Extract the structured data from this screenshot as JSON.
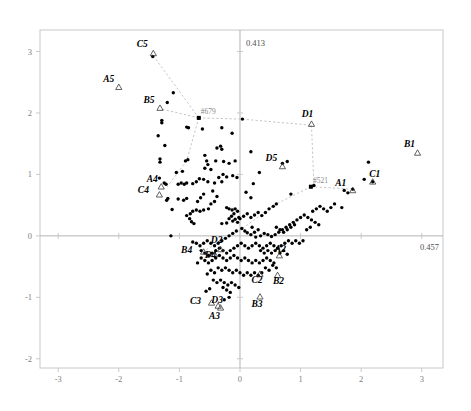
{
  "chart_data": {
    "type": "scatter",
    "title": "",
    "subtitle": "",
    "xlabel": "",
    "ylabel": "",
    "xlim": [
      -3.3,
      3.35
    ],
    "ylim": [
      -2.15,
      3.35
    ],
    "grid": false,
    "legend": null,
    "xticks": [
      "-3",
      "-2",
      "-1",
      "0",
      "1",
      "2",
      "3"
    ],
    "xtick_values": [
      -3,
      -2,
      -1,
      0,
      1,
      2,
      3
    ],
    "yticks": [
      "3",
      "2",
      "1",
      "0",
      "-1",
      "-2"
    ],
    "ytick_values": [
      3,
      2,
      1,
      0,
      -1,
      -2
    ],
    "axis_inertia": {
      "vertical_label": "0.413",
      "horizontal_label": "0.457"
    },
    "annotations": [
      {
        "name": "#679",
        "x": -0.68,
        "y": 1.92
      },
      {
        "name": "#521",
        "x": 1.17,
        "y": 0.8
      }
    ],
    "labeled_points": [
      {
        "label": "A1",
        "x": 1.86,
        "y": 0.74
      },
      {
        "label": "B1",
        "x": 2.93,
        "y": 1.35
      },
      {
        "label": "C1",
        "x": 2.19,
        "y": 0.88
      },
      {
        "label": "D1",
        "x": 1.18,
        "y": 1.82
      },
      {
        "label": "A2",
        "x": 0.65,
        "y": -0.32
      },
      {
        "label": "B2",
        "x": 0.62,
        "y": -0.64
      },
      {
        "label": "C2",
        "x": 0.33,
        "y": -0.62
      },
      {
        "label": "D2",
        "x": -0.32,
        "y": -0.22
      },
      {
        "label": "A3",
        "x": -0.32,
        "y": -1.17
      },
      {
        "label": "B3",
        "x": 0.33,
        "y": -0.99
      },
      {
        "label": "C3",
        "x": -0.47,
        "y": -1.09
      },
      {
        "label": "D3",
        "x": -0.36,
        "y": -1.14
      },
      {
        "label": "A4",
        "x": -1.3,
        "y": 0.8
      },
      {
        "label": "B4",
        "x": -0.6,
        "y": -0.26
      },
      {
        "label": "C4",
        "x": -1.33,
        "y": 0.67
      },
      {
        "label": "D4",
        "x": -0.42,
        "y": -0.3
      },
      {
        "label": "A5",
        "x": -2.0,
        "y": 2.42
      },
      {
        "label": "B5",
        "x": -1.32,
        "y": 2.08
      },
      {
        "label": "C5",
        "x": -1.43,
        "y": 2.97
      },
      {
        "label": "D5",
        "x": 0.7,
        "y": 1.13
      }
    ],
    "label_offsets": {
      "A1": [
        -12,
        -4
      ],
      "B1": [
        -8,
        -6
      ],
      "C1": [
        2,
        -5
      ],
      "D1": [
        -4,
        -7
      ],
      "A2": [
        1,
        -4
      ],
      "B2": [
        1,
        9
      ],
      "C2": [
        -3,
        9
      ],
      "D2": [
        -4,
        -6
      ],
      "A3": [
        -6,
        11
      ],
      "B3": [
        -3,
        10
      ],
      "C3": [
        -16,
        1
      ],
      "D3": [
        -1,
        -3
      ],
      "A4": [
        -9,
        -5
      ],
      "B4": [
        -17,
        1
      ],
      "C4": [
        -16,
        -2
      ],
      "D4": [
        -4,
        4
      ],
      "A5": [
        -10,
        -5
      ],
      "B5": [
        -11,
        -5
      ],
      "C5": [
        -11,
        -6
      ],
      "D5": [
        -11,
        -5
      ]
    },
    "polygon_links": [
      [
        [
          -1.43,
          2.93
        ],
        [
          -0.68,
          1.92
        ]
      ],
      [
        [
          -1.28,
          2.06
        ],
        [
          -0.68,
          1.92
        ]
      ],
      [
        [
          -0.68,
          1.92
        ],
        [
          -0.88,
          1.22
        ]
      ],
      [
        [
          -0.88,
          1.22
        ],
        [
          -1.2,
          0.8
        ]
      ],
      [
        [
          -0.68,
          1.92
        ],
        [
          0.04,
          1.9
        ]
      ],
      [
        [
          0.04,
          1.9
        ],
        [
          1.18,
          1.8
        ]
      ],
      [
        [
          1.18,
          1.8
        ],
        [
          1.22,
          0.82
        ]
      ],
      [
        [
          1.22,
          0.82
        ],
        [
          1.17,
          0.8
        ]
      ],
      [
        [
          1.17,
          0.8
        ],
        [
          1.86,
          0.76
        ]
      ],
      [
        [
          1.17,
          0.8
        ],
        [
          0.6,
          0.52
        ]
      ],
      [
        [
          0.6,
          0.52
        ],
        [
          -0.02,
          0.08
        ]
      ],
      [
        [
          -0.02,
          0.08
        ],
        [
          -0.62,
          -0.26
        ]
      ],
      [
        [
          -0.62,
          -0.26
        ],
        [
          -0.42,
          -0.3
        ]
      ]
    ],
    "points": [
      [
        -1.44,
        2.92
      ],
      [
        -1.1,
        2.33
      ],
      [
        -1.2,
        2.17
      ],
      [
        -1.29,
        1.88
      ],
      [
        -1.29,
        1.84
      ],
      [
        -1.35,
        1.63
      ],
      [
        -1.24,
        1.47
      ],
      [
        -1.32,
        1.25
      ],
      [
        -1.32,
        1.2
      ],
      [
        -1.33,
        0.94
      ],
      [
        -1.25,
        0.86
      ],
      [
        -1.22,
        0.84
      ],
      [
        -1.19,
        0.61
      ],
      [
        -1.21,
        0.58
      ],
      [
        -1.12,
        0.43
      ],
      [
        -1.14,
        0.0
      ],
      [
        -0.68,
        1.92
      ],
      [
        -0.88,
        1.77
      ],
      [
        -0.85,
        1.76
      ],
      [
        -0.62,
        1.74
      ],
      [
        -0.3,
        1.76
      ],
      [
        -0.13,
        1.67
      ],
      [
        0.04,
        1.9
      ],
      [
        -0.38,
        1.43
      ],
      [
        -0.3,
        1.41
      ],
      [
        -0.32,
        1.46
      ],
      [
        -0.58,
        1.31
      ],
      [
        -0.55,
        1.22
      ],
      [
        -0.53,
        1.16
      ],
      [
        -0.58,
        1.1
      ],
      [
        -0.48,
        1.08
      ],
      [
        -0.4,
        1.22
      ],
      [
        -0.27,
        1.21
      ],
      [
        -0.18,
        1.18
      ],
      [
        -0.08,
        1.22
      ],
      [
        0.18,
        1.37
      ],
      [
        0.32,
        1.03
      ],
      [
        0.7,
        1.18
      ],
      [
        0.78,
        1.21
      ],
      [
        0.22,
        0.85
      ],
      [
        0.1,
        0.71
      ],
      [
        0.18,
        0.62
      ],
      [
        -0.05,
        0.95
      ],
      [
        -0.12,
        0.98
      ],
      [
        -0.22,
        0.96
      ],
      [
        -0.28,
        1.0
      ],
      [
        -0.35,
        0.95
      ],
      [
        -0.3,
        0.88
      ],
      [
        -0.42,
        0.86
      ],
      [
        -0.53,
        0.88
      ],
      [
        -0.6,
        0.92
      ],
      [
        -0.67,
        0.93
      ],
      [
        -0.72,
        0.88
      ],
      [
        -0.78,
        0.85
      ],
      [
        -0.88,
        0.86
      ],
      [
        -0.92,
        0.84
      ],
      [
        -0.97,
        0.86
      ],
      [
        -1.02,
        0.84
      ],
      [
        -0.88,
        0.61
      ],
      [
        -0.93,
        0.58
      ],
      [
        -1.02,
        0.6
      ],
      [
        -0.45,
        0.73
      ],
      [
        -0.38,
        0.64
      ],
      [
        -0.42,
        0.56
      ],
      [
        -0.48,
        0.52
      ],
      [
        -0.52,
        0.44
      ],
      [
        -0.6,
        0.42
      ],
      [
        -0.66,
        0.4
      ],
      [
        -0.72,
        0.42
      ],
      [
        -0.78,
        0.4
      ],
      [
        -0.82,
        0.36
      ],
      [
        -0.88,
        0.33
      ],
      [
        -0.83,
        0.28
      ],
      [
        -0.8,
        0.23
      ],
      [
        -0.76,
        0.2
      ],
      [
        -0.6,
        0.68
      ],
      [
        -0.65,
        0.62
      ],
      [
        -0.7,
        0.56
      ],
      [
        -0.22,
        0.46
      ],
      [
        -0.18,
        0.44
      ],
      [
        -0.13,
        0.42
      ],
      [
        -0.08,
        0.44
      ],
      [
        -0.04,
        0.4
      ],
      [
        -0.1,
        0.36
      ],
      [
        -0.14,
        0.32
      ],
      [
        -0.18,
        0.28
      ],
      [
        -0.12,
        0.24
      ],
      [
        -0.08,
        0.27
      ],
      [
        -0.04,
        0.22
      ],
      [
        -0.22,
        0.21
      ],
      [
        -0.3,
        0.2
      ],
      [
        -0.02,
        0.3
      ],
      [
        0.03,
        0.12
      ],
      [
        0.08,
        0.08
      ],
      [
        0.12,
        0.05
      ],
      [
        0.18,
        0.02
      ],
      [
        0.24,
        0.06
      ],
      [
        0.3,
        0.1
      ],
      [
        0.2,
        0.14
      ],
      [
        0.26,
        -0.02
      ],
      [
        0.34,
        0.0
      ],
      [
        0.4,
        0.04
      ],
      [
        0.46,
        0.02
      ],
      [
        0.52,
        -0.01
      ],
      [
        0.58,
        0.02
      ],
      [
        0.64,
        0.06
      ],
      [
        0.7,
        0.1
      ],
      [
        0.76,
        0.14
      ],
      [
        0.82,
        0.18
      ],
      [
        0.88,
        0.22
      ],
      [
        0.94,
        0.26
      ],
      [
        1.0,
        0.3
      ],
      [
        1.06,
        0.34
      ],
      [
        1.12,
        0.3
      ],
      [
        1.18,
        0.26
      ],
      [
        1.24,
        0.22
      ],
      [
        1.3,
        0.18
      ],
      [
        1.2,
        0.4
      ],
      [
        1.26,
        0.44
      ],
      [
        1.32,
        0.48
      ],
      [
        1.38,
        0.44
      ],
      [
        1.44,
        0.4
      ],
      [
        1.5,
        0.46
      ],
      [
        1.56,
        0.52
      ],
      [
        1.68,
        0.46
      ],
      [
        1.72,
        0.74
      ],
      [
        1.78,
        0.7
      ],
      [
        1.86,
        0.76
      ],
      [
        2.05,
        0.92
      ],
      [
        2.12,
        1.2
      ],
      [
        2.19,
        0.88
      ],
      [
        1.17,
        0.8
      ],
      [
        1.22,
        0.82
      ],
      [
        0.84,
        0.68
      ],
      [
        0.6,
        0.52
      ],
      [
        0.55,
        0.48
      ],
      [
        0.48,
        0.44
      ],
      [
        0.42,
        0.38
      ],
      [
        0.36,
        0.33
      ],
      [
        0.3,
        0.38
      ],
      [
        0.24,
        0.34
      ],
      [
        0.18,
        0.3
      ],
      [
        0.12,
        0.36
      ],
      [
        0.06,
        0.32
      ],
      [
        0.0,
        0.28
      ],
      [
        -0.06,
        0.08
      ],
      [
        -0.12,
        0.04
      ],
      [
        -0.18,
        0.0
      ],
      [
        -0.24,
        -0.04
      ],
      [
        -0.3,
        -0.08
      ],
      [
        -0.36,
        -0.12
      ],
      [
        -0.42,
        -0.16
      ],
      [
        -0.48,
        -0.12
      ],
      [
        -0.54,
        -0.08
      ],
      [
        -0.6,
        -0.12
      ],
      [
        -0.66,
        -0.16
      ],
      [
        -0.72,
        -0.12
      ],
      [
        -0.78,
        -0.1
      ],
      [
        -0.64,
        -0.24
      ],
      [
        -0.58,
        -0.28
      ],
      [
        -0.52,
        -0.32
      ],
      [
        -0.46,
        -0.28
      ],
      [
        -0.4,
        -0.24
      ],
      [
        -0.34,
        -0.2
      ],
      [
        -0.28,
        -0.24
      ],
      [
        -0.22,
        -0.28
      ],
      [
        -0.16,
        -0.24
      ],
      [
        -0.1,
        -0.2
      ],
      [
        -0.04,
        -0.16
      ],
      [
        0.02,
        -0.12
      ],
      [
        0.08,
        -0.16
      ],
      [
        0.14,
        -0.2
      ],
      [
        0.2,
        -0.16
      ],
      [
        0.26,
        -0.12
      ],
      [
        0.32,
        -0.16
      ],
      [
        0.38,
        -0.2
      ],
      [
        0.44,
        -0.16
      ],
      [
        0.5,
        -0.12
      ],
      [
        0.56,
        -0.16
      ],
      [
        0.62,
        -0.2
      ],
      [
        0.68,
        -0.16
      ],
      [
        0.74,
        -0.12
      ],
      [
        0.8,
        -0.08
      ],
      [
        0.86,
        -0.12
      ],
      [
        0.92,
        -0.08
      ],
      [
        0.98,
        -0.12
      ],
      [
        1.04,
        -0.08
      ],
      [
        1.1,
        0.1
      ],
      [
        1.16,
        0.14
      ],
      [
        0.9,
        0.18
      ],
      [
        0.84,
        0.14
      ],
      [
        0.78,
        0.1
      ],
      [
        0.72,
        0.06
      ],
      [
        0.66,
        0.1
      ],
      [
        0.6,
        0.14
      ],
      [
        -0.46,
        -0.4
      ],
      [
        -0.52,
        -0.44
      ],
      [
        -0.58,
        -0.4
      ],
      [
        -0.64,
        -0.36
      ],
      [
        -0.7,
        -0.44
      ],
      [
        -0.4,
        -0.36
      ],
      [
        -0.34,
        -0.32
      ],
      [
        -0.28,
        -0.36
      ],
      [
        -0.22,
        -0.4
      ],
      [
        -0.16,
        -0.36
      ],
      [
        -0.1,
        -0.32
      ],
      [
        -0.04,
        -0.36
      ],
      [
        0.02,
        -0.4
      ],
      [
        0.08,
        -0.36
      ],
      [
        0.14,
        -0.4
      ],
      [
        0.2,
        -0.44
      ],
      [
        0.26,
        -0.4
      ],
      [
        0.32,
        -0.44
      ],
      [
        0.38,
        -0.4
      ],
      [
        0.44,
        -0.36
      ],
      [
        0.5,
        -0.4
      ],
      [
        0.56,
        -0.44
      ],
      [
        -0.36,
        -0.52
      ],
      [
        -0.3,
        -0.56
      ],
      [
        -0.24,
        -0.52
      ],
      [
        -0.18,
        -0.56
      ],
      [
        -0.12,
        -0.6
      ],
      [
        -0.06,
        -0.56
      ],
      [
        0.0,
        -0.6
      ],
      [
        0.06,
        -0.64
      ],
      [
        0.12,
        -0.6
      ],
      [
        0.18,
        -0.64
      ],
      [
        0.24,
        -0.6
      ],
      [
        0.3,
        -0.64
      ],
      [
        0.36,
        -0.6
      ],
      [
        -0.42,
        -0.6
      ],
      [
        -0.48,
        -0.56
      ],
      [
        -0.54,
        -0.62
      ],
      [
        -0.44,
        -0.72
      ],
      [
        -0.38,
        -0.76
      ],
      [
        -0.32,
        -0.72
      ],
      [
        -0.26,
        -0.76
      ],
      [
        -0.2,
        -0.8
      ],
      [
        -0.14,
        -0.76
      ],
      [
        -0.08,
        -0.8
      ],
      [
        -0.02,
        -0.84
      ],
      [
        -0.22,
        -0.88
      ],
      [
        -0.16,
        -0.92
      ],
      [
        -0.28,
        -0.84
      ],
      [
        -0.5,
        -0.86
      ],
      [
        -0.56,
        -0.9
      ],
      [
        -0.26,
        -1.04
      ],
      [
        -0.18,
        -1.0
      ],
      [
        0.42,
        -0.52
      ],
      [
        0.48,
        -0.56
      ],
      [
        0.54,
        -0.48
      ],
      [
        0.6,
        -0.52
      ],
      [
        0.66,
        -0.28
      ],
      [
        0.72,
        -0.24
      ],
      [
        0.78,
        -0.3
      ],
      [
        0.4,
        -0.28
      ],
      [
        0.46,
        -0.24
      ],
      [
        0.52,
        -0.28
      ],
      [
        0.58,
        -0.24
      ],
      [
        0.34,
        -0.24
      ],
      [
        -0.9,
        1.22
      ],
      [
        -0.86,
        1.24
      ],
      [
        -1.05,
        1.03
      ],
      [
        -0.95,
        1.05
      ]
    ]
  }
}
